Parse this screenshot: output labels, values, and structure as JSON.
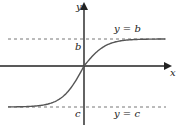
{
  "chart_data": {
    "type": "line",
    "title": "",
    "xlabel": "x",
    "ylabel": "y",
    "curve": "increasing sigmoid through origin approaching horizontal asymptotes",
    "asymptotes": [
      {
        "name": "upper",
        "equation": "y = b",
        "value_label": "b"
      },
      {
        "name": "lower",
        "equation": "y = c",
        "value_label": "c"
      }
    ],
    "asymptote_style": "dashed",
    "axis_arrows": true,
    "grid": false
  },
  "colors": {
    "axis": "#222222",
    "curve": "#555555",
    "asymptote": "#777777"
  }
}
